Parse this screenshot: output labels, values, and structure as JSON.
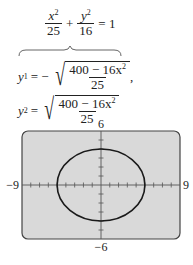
{
  "equations": {
    "main": {
      "x_term": "x",
      "x_exp": "2",
      "x_den": "25",
      "plus": "+",
      "y_term": "y",
      "y_exp": "2",
      "y_den": "16",
      "equals": "= 1"
    },
    "y1": {
      "lhs": "y",
      "sub": "1",
      "eq": "= −",
      "num": "400 − 16x",
      "num_exp": "2",
      "den": "25",
      "trail": ","
    },
    "y2": {
      "lhs": "y",
      "sub": "2",
      "eq": "=",
      "num": "400 − 16x",
      "num_exp": "2",
      "den": "25"
    }
  },
  "chart_data": {
    "type": "line",
    "title": "",
    "curve": "ellipse x^2/25 + y^2/16 = 1",
    "series": [
      {
        "name": "ellipse",
        "a": 5,
        "b": 4,
        "center": [
          0,
          0
        ]
      }
    ],
    "xlim": [
      -9,
      9
    ],
    "ylim": [
      -6,
      6
    ],
    "x_tick_step": 1,
    "y_tick_step": 1,
    "tick_labels": {
      "xmin": "−9",
      "xmax": "9",
      "ymin": "−6",
      "ymax": "6"
    },
    "grid": false,
    "background": "#d9d9d9",
    "curve_color": "#1a1a1a"
  }
}
